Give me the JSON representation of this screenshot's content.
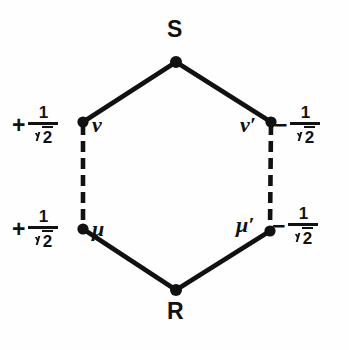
{
  "figure": {
    "type": "hexagon-state-diagram",
    "background_color": "#fefefe",
    "stroke_color": "#111111"
  },
  "vertices": {
    "top": {
      "label": "S",
      "x": 176,
      "y": 62
    },
    "bottom": {
      "label": "R",
      "x": 176,
      "y": 290
    },
    "upper_left": {
      "label": "ν",
      "x": 82,
      "y": 122
    },
    "upper_right": {
      "label": "ν′",
      "x": 272,
      "y": 122
    },
    "lower_left": {
      "label": "μ",
      "x": 82,
      "y": 228
    },
    "lower_right": {
      "label": "μ′",
      "x": 270,
      "y": 230
    }
  },
  "coefficients": {
    "upper_left": {
      "sign": "+",
      "numerator": "1",
      "denominator_radicand": "2"
    },
    "lower_left": {
      "sign": "+",
      "numerator": "1",
      "denominator_radicand": "2"
    },
    "upper_right": {
      "sign": "−",
      "numerator": "1",
      "denominator_radicand": "2"
    },
    "lower_right": {
      "sign": "−",
      "numerator": "1",
      "denominator_radicand": "2"
    }
  },
  "edges": {
    "solid": [
      {
        "from": "S",
        "to": "ν"
      },
      {
        "from": "S",
        "to": "ν′"
      },
      {
        "from": "μ",
        "to": "R"
      },
      {
        "from": "μ′",
        "to": "R"
      }
    ],
    "dashed": [
      {
        "from": "ν",
        "to": "μ"
      },
      {
        "from": "ν′",
        "to": "μ′"
      }
    ]
  }
}
